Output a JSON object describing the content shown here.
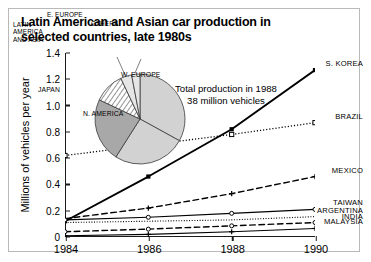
{
  "title": "Latin American and Asian car production in selected countries, late 1980s",
  "annotation": {
    "line1": "Total production in 1988",
    "line2": "38 million vehicles"
  },
  "pie_labels": {
    "w_europe": "W. EUROPE",
    "n_america": "N. AMERICA",
    "japan": "JAPAN",
    "latin_america_asia": "LATIN\nAMERICA\nAND ASIA",
    "e_europe": "E. EUROPE",
    "others": "OTHERS"
  },
  "chart_data": {
    "type": "line",
    "title": "Latin American and Asian car production in selected countries, late 1980s",
    "xlabel": "",
    "ylabel": "Millions of vehicles per year",
    "x": [
      1984,
      1986,
      1988,
      1990
    ],
    "xtick_labels": [
      "1984",
      "1986",
      "1988",
      "1990"
    ],
    "xlim": [
      1984,
      1990
    ],
    "ylim": [
      0,
      1.4
    ],
    "ytick_labels": [
      "0",
      "0.2",
      "0.4",
      "0.6",
      "0.8",
      "1.0",
      "1.2",
      "1.4"
    ],
    "ytick_values": [
      0,
      0.2,
      0.4,
      0.6,
      0.8,
      1.0,
      1.2,
      1.4
    ],
    "grid": false,
    "legend": "right-edge inline labels",
    "series": [
      {
        "name": "S. KOREA",
        "values": [
          0.12,
          0.46,
          0.82,
          1.27
        ],
        "style": "solid",
        "width": 1.9,
        "marker": "square-filled"
      },
      {
        "name": "BRAZIL",
        "values": [
          0.62,
          0.7,
          0.78,
          0.87
        ],
        "style": "dotted",
        "width": 1.3,
        "marker": "square-open"
      },
      {
        "name": "MEXICO",
        "values": [
          0.14,
          0.22,
          0.33,
          0.46
        ],
        "style": "dashed",
        "width": 1.4,
        "marker": "plus"
      },
      {
        "name": "TAIWAN",
        "values": [
          0.13,
          0.15,
          0.18,
          0.21
        ],
        "style": "solid",
        "width": 1.1,
        "marker": "circle-open"
      },
      {
        "name": "ARGENTINA",
        "values": [
          0.11,
          0.12,
          0.13,
          0.155
        ],
        "style": "dotted",
        "width": 1.1,
        "marker": "none"
      },
      {
        "name": "INDIA",
        "values": [
          0.04,
          0.06,
          0.085,
          0.11
        ],
        "style": "dashed",
        "width": 1.4,
        "marker": "circle-open"
      },
      {
        "name": "MALAYSIA",
        "values": [
          0.01,
          0.02,
          0.04,
          0.065
        ],
        "style": "solid",
        "width": 1.1,
        "marker": "plus"
      }
    ],
    "inset_pie": {
      "type": "pie",
      "title": "Total production in 1988, 38 million vehicles",
      "total_label": "38 million vehicles",
      "slices": [
        {
          "name": "W. EUROPE",
          "percent": 33
        },
        {
          "name": "N. AMERICA",
          "percent": 26
        },
        {
          "name": "JAPAN",
          "percent": 23
        },
        {
          "name": "LATIN AMERICA AND ASIA",
          "percent": 11
        },
        {
          "name": "E. EUROPE",
          "percent": 4
        },
        {
          "name": "OTHERS",
          "percent": 3
        }
      ]
    }
  },
  "colors": {
    "axis": "#1a1a1a",
    "ink": "#000000",
    "pie_light": "#d2d2d2",
    "pie_mid": "#a8a8a8",
    "pie_pale": "#e6e6e6",
    "border": "#b9b9b9",
    "background": "#ffffff"
  }
}
